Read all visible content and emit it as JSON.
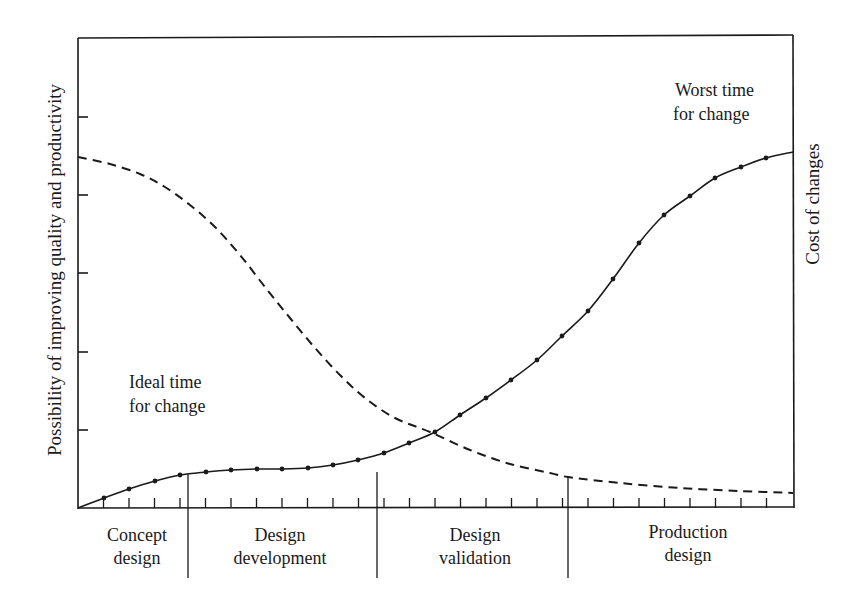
{
  "chart_data": {
    "type": "line",
    "title": "",
    "ylabel_left": "Possibility of improving quality and productivity",
    "ylabel_right": "Cost of changes",
    "xlabel": "",
    "phases": [
      {
        "label_line1": "Concept",
        "label_line2": "design",
        "x_start": 78,
        "x_end": 188
      },
      {
        "label_line1": "Design",
        "label_line2": "development",
        "x_start": 188,
        "x_end": 377
      },
      {
        "label_line1": "Design",
        "label_line2": "validation",
        "x_start": 377,
        "x_end": 568
      },
      {
        "label_line1": "Production",
        "label_line2": "design",
        "x_start": 568,
        "x_end": 793
      }
    ],
    "annotations": [
      {
        "id": "ideal",
        "line1": "Ideal time",
        "line2": "for change"
      },
      {
        "id": "worst",
        "line1": "Worst time",
        "line2": "for change"
      }
    ],
    "series": [
      {
        "name": "Possibility of improving quality and productivity",
        "style": "dashed",
        "description": "Starts high (~0.76 of axis) and falls sigmoidally to near zero by end of production design",
        "points_px": [
          [
            78,
            157
          ],
          [
            110,
            164
          ],
          [
            140,
            174
          ],
          [
            165,
            187
          ],
          [
            190,
            205
          ],
          [
            215,
            227
          ],
          [
            240,
            255
          ],
          [
            265,
            287
          ],
          [
            290,
            318
          ],
          [
            315,
            348
          ],
          [
            340,
            375
          ],
          [
            365,
            398
          ],
          [
            395,
            418
          ],
          [
            430,
            432
          ],
          [
            470,
            450
          ],
          [
            510,
            464
          ],
          [
            550,
            473
          ],
          [
            568,
            477
          ],
          [
            620,
            483
          ],
          [
            680,
            488
          ],
          [
            740,
            491
          ],
          [
            793,
            493
          ]
        ]
      },
      {
        "name": "Cost of changes",
        "style": "solid-with-markers",
        "description": "Starts at zero, plateaus during design development, rises steeply in validation and production design",
        "points_px": [
          [
            78,
            508
          ],
          [
            104,
            498
          ],
          [
            129,
            489
          ],
          [
            155,
            481
          ],
          [
            180,
            475
          ],
          [
            206,
            472
          ],
          [
            231,
            470
          ],
          [
            257,
            469
          ],
          [
            282,
            469
          ],
          [
            308,
            468
          ],
          [
            333,
            465
          ],
          [
            358,
            460
          ],
          [
            384,
            453
          ],
          [
            409,
            443
          ],
          [
            435,
            432
          ],
          [
            460,
            415
          ],
          [
            486,
            398
          ],
          [
            511,
            380
          ],
          [
            537,
            360
          ],
          [
            562,
            336
          ],
          [
            588,
            311
          ],
          [
            613,
            279
          ],
          [
            639,
            243
          ],
          [
            664,
            215
          ],
          [
            690,
            196
          ],
          [
            715,
            178
          ],
          [
            741,
            167
          ],
          [
            766,
            158
          ],
          [
            793,
            152
          ]
        ]
      }
    ],
    "axes": {
      "plot_left": 78,
      "plot_top": 38,
      "plot_right": 793,
      "plot_bottom": 508,
      "left_ticks_y": [
        117,
        195,
        273,
        352,
        430
      ],
      "x_tick_spacing_px": 25.5,
      "x_tick_count": 28,
      "grid": false,
      "ylim": [
        0,
        1
      ],
      "tick_labels": []
    },
    "legend": null
  }
}
